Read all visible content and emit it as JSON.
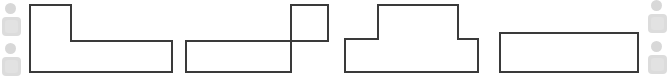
{
  "canvas": {
    "width": 668,
    "height": 80,
    "background": "#ffffff",
    "stroke_color": "#3a3a3a",
    "fill_color": "#ffffff",
    "stroke_width": 2
  },
  "shapes": [
    {
      "id": "shape-1",
      "name": "l-shape-left-riser",
      "label": "L shape, vertical riser on left",
      "points": "30,5 71,5 71,41 172,41 172,72 30,72"
    },
    {
      "id": "shape-2",
      "name": "l-shape-right-riser",
      "label": "Mirrored L shape, vertical riser on right",
      "points": "291,5 328,5 328,41 186,41 186,72 291,72"
    },
    {
      "id": "shape-3",
      "name": "t-shape-plateau",
      "label": "T shape with raised central plateau",
      "points": "378,5 458,5 458,39 478,39 478,72 345,72 345,39 378,39"
    },
    {
      "id": "shape-4",
      "name": "rectangle-bar",
      "label": "Horizontal rectangle bar",
      "points": "500,33 638,33 638,72 500,72"
    }
  ],
  "decorations": {
    "accent_dot_color": "#d8d8d8",
    "accent_tile_color": "#dcdcdc",
    "accent_tile_inner_color": "#e2e2e2",
    "left": [
      {
        "name": "deco-dot-1",
        "type": "dot",
        "x": 5,
        "y": 3,
        "size": 11
      },
      {
        "name": "deco-tile-1",
        "type": "tile",
        "x": 2,
        "y": 17,
        "size": 19
      },
      {
        "name": "deco-dot-2",
        "type": "dot",
        "x": 5,
        "y": 43,
        "size": 11
      },
      {
        "name": "deco-tile-2",
        "type": "tile",
        "x": 2,
        "y": 57,
        "size": 19
      }
    ],
    "right": [
      {
        "name": "deco-dot-3",
        "type": "dot",
        "x": 7,
        "y": 0,
        "size": 11
      },
      {
        "name": "deco-tile-3",
        "type": "tile",
        "x": 4,
        "y": 14,
        "size": 19
      },
      {
        "name": "deco-dot-4",
        "type": "dot",
        "x": 7,
        "y": 41,
        "size": 11
      },
      {
        "name": "deco-tile-4",
        "type": "tile",
        "x": 4,
        "y": 55,
        "size": 19
      }
    ]
  }
}
